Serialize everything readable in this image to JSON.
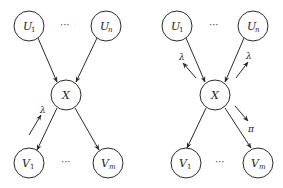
{
  "diagrams": [
    {
      "id": "left",
      "nodes": {
        "u1": {
          "label": "U",
          "sub": "1",
          "cx": 29,
          "cy": 26
        },
        "un": {
          "label": "U",
          "sub": "n",
          "cx": 106,
          "cy": 26
        },
        "x": {
          "label": "X",
          "sub": "",
          "cx": 66,
          "cy": 95
        },
        "v1": {
          "label": "V",
          "sub": "1",
          "cx": 29,
          "cy": 163
        },
        "vm": {
          "label": "V",
          "sub": "m",
          "cx": 108,
          "cy": 163
        }
      },
      "top_ellipsis": "···",
      "bottom_ellipsis": "···",
      "annotations": [
        {
          "symbol": "λ",
          "near": "edge x→v1",
          "direction": "toward X"
        }
      ]
    },
    {
      "id": "right",
      "nodes": {
        "u1": {
          "label": "U",
          "sub": "1",
          "cx": 177,
          "cy": 26
        },
        "un": {
          "label": "U",
          "sub": "n",
          "cx": 253,
          "cy": 26
        },
        "x": {
          "label": "X",
          "sub": "",
          "cx": 215,
          "cy": 95
        },
        "v1": {
          "label": "V",
          "sub": "1",
          "cx": 186,
          "cy": 163
        },
        "vm": {
          "label": "V",
          "sub": "m",
          "cx": 258,
          "cy": 163
        }
      },
      "top_ellipsis": "···",
      "bottom_ellipsis": "···",
      "annotations": [
        {
          "symbol": "λ",
          "near": "edge u1→x",
          "direction": "toward U1"
        },
        {
          "symbol": "λ",
          "near": "edge un→x",
          "direction": "toward Un"
        },
        {
          "symbol": "π",
          "near": "edge x→vm",
          "direction": "toward Vm"
        }
      ]
    }
  ],
  "labels": {
    "lambda": "λ",
    "pi": "π",
    "ellipsis": "···",
    "U": "U",
    "V": "V",
    "X": "X",
    "sub_1": "1",
    "sub_n": "n",
    "sub_m": "m"
  }
}
